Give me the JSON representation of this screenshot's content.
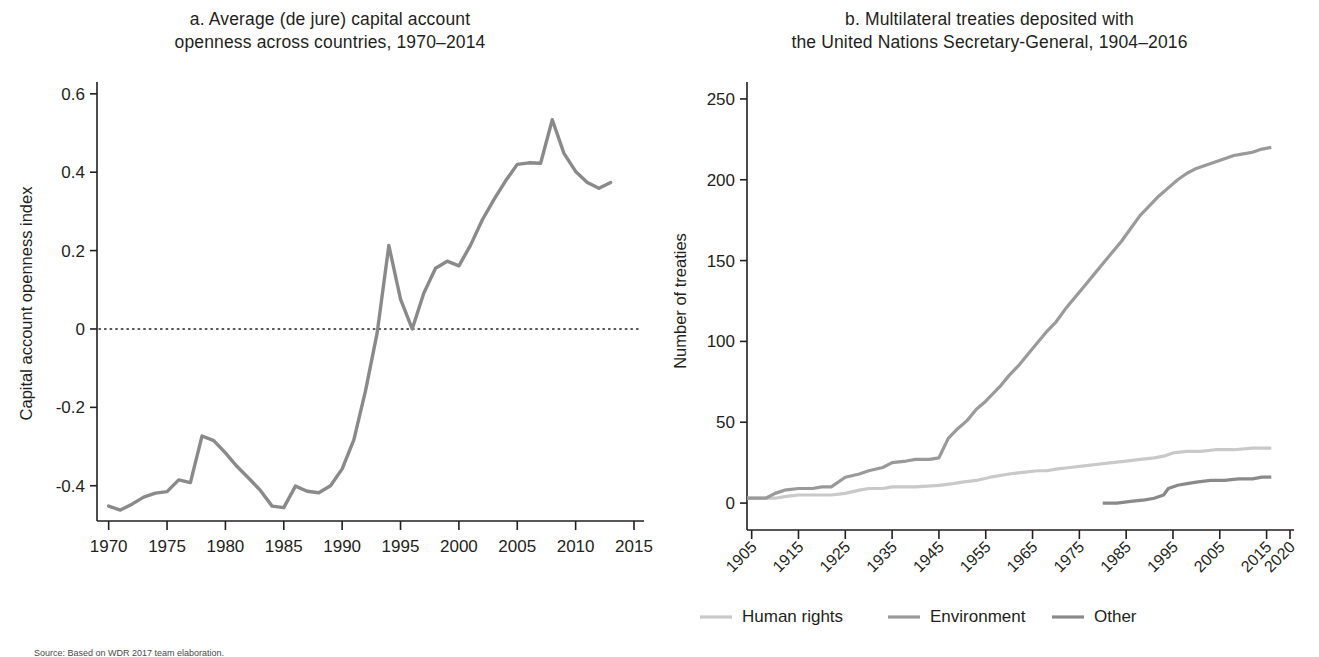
{
  "figure": {
    "background": "#ffffff",
    "source_note": "Source: Based on WDR 2017 team elaboration."
  },
  "panel_a": {
    "title": "a. Average (de jure) capital account\nopenness across countries, 1970–2014",
    "ylabel": "Capital account openness index",
    "line_color": "#8a8a8a",
    "zero_line_color": "#231f20"
  },
  "panel_b": {
    "title": "b. Multilateral treaties deposited with\nthe United Nations Secretary-General, 1904–2016",
    "ylabel": "Number of treaties",
    "legend": [
      {
        "label": "Human rights",
        "color": "#c9c9c9"
      },
      {
        "label": "Environment",
        "color": "#9a9a9a"
      },
      {
        "label": "Other",
        "color": "#8a8a8a"
      }
    ]
  },
  "chart_data": [
    {
      "type": "line",
      "panel": "a",
      "title": "a. Average (de jure) capital account openness across countries, 1970–2014",
      "xlabel": "",
      "ylabel": "Capital account openness index",
      "xlim": [
        1969,
        2015
      ],
      "ylim": [
        -0.49,
        0.62
      ],
      "xticks": [
        1970,
        1975,
        1980,
        1985,
        1990,
        1995,
        2000,
        2005,
        2010,
        2015
      ],
      "yticks": [
        -0.4,
        -0.2,
        0,
        0.2,
        0.4,
        0.6
      ],
      "ytick_labels": [
        "-0.4",
        "-0.2",
        "0",
        "0.2",
        "0.4",
        "0.6"
      ],
      "grid": false,
      "zero_reference_line": 0,
      "legend": "none",
      "series": [
        {
          "name": "Capital account openness index",
          "color": "#8a8a8a",
          "x": [
            1970,
            1971,
            1972,
            1973,
            1974,
            1975,
            1976,
            1977,
            1978,
            1979,
            1980,
            1981,
            1982,
            1983,
            1984,
            1985,
            1986,
            1987,
            1988,
            1989,
            1990,
            1991,
            1992,
            1993,
            1994,
            1995,
            1996,
            1997,
            1998,
            1999,
            2000,
            2001,
            2002,
            2003,
            2004,
            2005,
            2006,
            2007,
            2008,
            2009,
            2010,
            2011,
            2012,
            2013
          ],
          "values": [
            -0.452,
            -0.462,
            -0.447,
            -0.429,
            -0.419,
            -0.415,
            -0.385,
            -0.392,
            -0.273,
            -0.285,
            -0.316,
            -0.351,
            -0.381,
            -0.412,
            -0.452,
            -0.456,
            -0.401,
            -0.414,
            -0.418,
            -0.4,
            -0.357,
            -0.283,
            -0.158,
            -0.01,
            0.213,
            0.076,
            0.0,
            0.092,
            0.155,
            0.173,
            0.161,
            0.214,
            0.278,
            0.33,
            0.378,
            0.42,
            0.424,
            0.423,
            0.534,
            0.448,
            0.402,
            0.374,
            0.359,
            0.374
          ]
        }
      ]
    },
    {
      "type": "line",
      "panel": "b",
      "title": "b. Multilateral treaties deposited with the United Nations Secretary-General, 1904–2016",
      "xlabel": "",
      "ylabel": "Number of treaties",
      "xlim": [
        1904,
        2020
      ],
      "ylim": [
        -8,
        258
      ],
      "xticks": [
        1905,
        1915,
        1925,
        1935,
        1945,
        1955,
        1965,
        1975,
        1985,
        1995,
        2005,
        2015,
        2020
      ],
      "yticks": [
        0,
        50,
        100,
        150,
        200,
        250
      ],
      "ytick_labels": [
        "0",
        "50",
        "100",
        "150",
        "200",
        "250"
      ],
      "grid": false,
      "legend": "bottom",
      "series": [
        {
          "name": "Human rights",
          "color": "#c9c9c9",
          "x": [
            1904,
            1910,
            1912,
            1915,
            1920,
            1922,
            1925,
            1928,
            1930,
            1933,
            1935,
            1938,
            1940,
            1945,
            1948,
            1950,
            1953,
            1956,
            1960,
            1963,
            1966,
            1968,
            1970,
            1973,
            1976,
            1979,
            1982,
            1985,
            1988,
            1991,
            1993,
            1995,
            1998,
            2001,
            2004,
            2008,
            2012,
            2016
          ],
          "values": [
            3,
            3,
            4,
            5,
            5,
            5,
            6,
            8,
            9,
            9,
            10,
            10,
            10,
            11,
            12,
            13,
            14,
            16,
            18,
            19,
            20,
            20,
            21,
            22,
            23,
            24,
            25,
            26,
            27,
            28,
            29,
            31,
            32,
            32,
            33,
            33,
            34,
            34
          ]
        },
        {
          "name": "Environment",
          "color": "#9a9a9a",
          "x": [
            1904,
            1908,
            1910,
            1912,
            1915,
            1918,
            1920,
            1922,
            1925,
            1928,
            1930,
            1933,
            1935,
            1938,
            1940,
            1943,
            1945,
            1947,
            1949,
            1951,
            1953,
            1955,
            1958,
            1960,
            1962,
            1964,
            1966,
            1968,
            1970,
            1972,
            1974,
            1976,
            1978,
            1980,
            1982,
            1984,
            1986,
            1988,
            1990,
            1992,
            1994,
            1996,
            1998,
            2000,
            2002,
            2004,
            2006,
            2008,
            2010,
            2012,
            2014,
            2016
          ],
          "values": [
            3,
            3,
            6,
            8,
            9,
            9,
            10,
            10,
            16,
            18,
            20,
            22,
            25,
            26,
            27,
            27,
            28,
            40,
            46,
            51,
            58,
            63,
            72,
            79,
            85,
            92,
            99,
            106,
            112,
            120,
            127,
            134,
            141,
            148,
            155,
            162,
            170,
            178,
            184,
            190,
            195,
            200,
            204,
            207,
            209,
            211,
            213,
            215,
            216,
            217,
            219,
            220
          ]
        },
        {
          "name": "Other",
          "color": "#8a8a8a",
          "x": [
            1980,
            1983,
            1986,
            1989,
            1991,
            1993,
            1994,
            1996,
            1998,
            2000,
            2003,
            2006,
            2009,
            2012,
            2014,
            2016
          ],
          "values": [
            0,
            0,
            1,
            2,
            3,
            5,
            9,
            11,
            12,
            13,
            14,
            14,
            15,
            15,
            16,
            16
          ]
        }
      ]
    }
  ]
}
